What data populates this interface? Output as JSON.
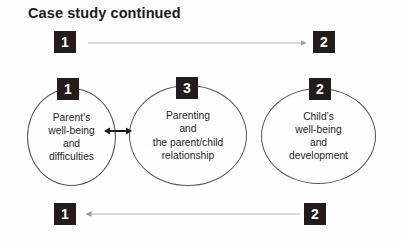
{
  "slide": {
    "title": "Case study continued",
    "background_color": "#fefefe",
    "box_color": "#241c1a",
    "box_text_color": "#ffffff",
    "ellipse_border_color": "#5a5048",
    "arrow_color": "#b0b0b0"
  },
  "top_row": {
    "left_box_label": "1",
    "right_box_label": "2",
    "arrow_direction": "right"
  },
  "bottom_row": {
    "left_box_label": "1",
    "right_box_label": "2",
    "arrow_direction": "left"
  },
  "connector": {
    "direction": "double",
    "between": "parent-ellipse and parenting-ellipse"
  },
  "ellipses": [
    {
      "id": "parent-wellbeing",
      "box_label": "1",
      "lines": [
        "Parent’s",
        "well-being",
        "and",
        "difficulties"
      ],
      "text": "Parent’s well-being and difficulties"
    },
    {
      "id": "parenting-relationship",
      "box_label": "3",
      "lines": [
        "Parenting",
        "and",
        "the parent/child",
        "relationship"
      ],
      "text": "Parenting and the parent/child relationship"
    },
    {
      "id": "child-wellbeing",
      "box_label": "2",
      "lines": [
        "Child’s",
        "well-being",
        "and",
        "development"
      ],
      "text": "Child’s well-being and development"
    }
  ]
}
